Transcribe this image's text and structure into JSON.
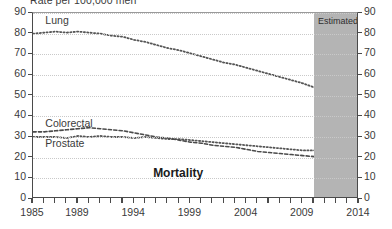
{
  "chart_data": {
    "type": "line",
    "title": "Rate per 100,000 men",
    "subtitle": "Mortality",
    "xlabel": "",
    "ylabel": "Rate per 100,000 men",
    "xlim": [
      1985,
      2014
    ],
    "ylim": [
      0,
      90
    ],
    "grid": true,
    "legend_position": "inline-labels",
    "y_ticks": [
      0,
      10,
      20,
      30,
      40,
      50,
      60,
      70,
      80,
      90
    ],
    "x_ticks": [
      1985,
      1986,
      1987,
      1988,
      1989,
      1990,
      1991,
      1992,
      1993,
      1994,
      1995,
      1996,
      1997,
      1998,
      1999,
      2000,
      2001,
      2002,
      2003,
      2004,
      2005,
      2006,
      2007,
      2008,
      2009,
      2010,
      2011,
      2012,
      2013,
      2014
    ],
    "x_tick_labels": [
      "1985",
      "1989",
      "1994",
      "1999",
      "2004",
      "2009",
      "2014"
    ],
    "x_tick_label_values": [
      1985,
      1989,
      1994,
      1999,
      2004,
      2009,
      2014
    ],
    "annotations": [
      {
        "name": "estimated-band-label",
        "text": "Estimated",
        "x_start": 2010,
        "x_end": 2014
      },
      {
        "name": "mortality-annotation",
        "text": "Mortality",
        "x": 1998,
        "y": 12
      }
    ],
    "x": [
      1985,
      1986,
      1987,
      1988,
      1989,
      1990,
      1991,
      1992,
      1993,
      1994,
      1995,
      1996,
      1997,
      1998,
      1999,
      2000,
      2001,
      2002,
      2003,
      2004,
      2005,
      2006,
      2007,
      2008,
      2009,
      2010,
      2011,
      2012,
      2013,
      2014
    ],
    "series": [
      {
        "name": "Lung",
        "label": "Lung",
        "style": "dotted",
        "color": "#555555",
        "values": [
          80.0,
          80.5,
          81.0,
          80.5,
          81.0,
          80.5,
          80.0,
          79.0,
          78.5,
          77.0,
          76.0,
          74.5,
          73.0,
          72.0,
          70.5,
          69.0,
          67.5,
          66.0,
          65.0,
          63.5,
          62.0,
          60.5,
          59.0,
          57.5,
          56.0,
          54.0,
          52.0,
          50.5,
          48.5,
          47.0
        ]
      },
      {
        "name": "Colorectal",
        "label": "Colorectal",
        "style": "dotted",
        "color": "#555555",
        "values": [
          30.0,
          30.0,
          30.0,
          29.5,
          30.5,
          30.0,
          30.5,
          30.0,
          30.0,
          29.5,
          30.0,
          29.5,
          29.0,
          29.0,
          28.5,
          28.0,
          27.5,
          27.0,
          26.5,
          26.0,
          25.5,
          25.0,
          24.5,
          24.0,
          23.5,
          23.5,
          23.0,
          23.0,
          22.5,
          22.0
        ]
      },
      {
        "name": "Prostate",
        "label": "Prostate",
        "style": "dashed",
        "color": "#4a4a4a",
        "values": [
          32.5,
          32.5,
          33.0,
          33.5,
          34.0,
          34.5,
          34.0,
          33.5,
          33.0,
          32.0,
          31.0,
          30.0,
          29.5,
          28.5,
          27.5,
          27.0,
          26.0,
          25.5,
          25.0,
          24.0,
          23.0,
          22.5,
          22.0,
          21.5,
          21.0,
          20.5,
          20.5,
          20.5,
          21.0,
          21.0
        ]
      }
    ]
  },
  "colors": {
    "axis": "#4a4a4a",
    "gridline": "#c9c9c9",
    "estimated_band": "#b4b4b4",
    "text": "#3a3a3a",
    "background": "#ffffff"
  }
}
